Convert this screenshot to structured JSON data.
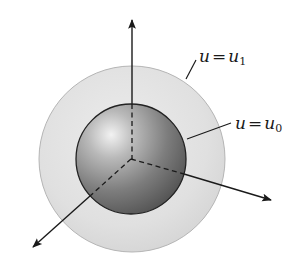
{
  "diagram": {
    "type": "concentric-spheres-3d-axes",
    "labels": {
      "outer": {
        "var": "u",
        "equals": "=",
        "rhs_var": "u",
        "rhs_sub": "1"
      },
      "inner": {
        "var": "u",
        "equals": "=",
        "rhs_var": "u",
        "rhs_sub": "0"
      }
    },
    "colors": {
      "outer_fill": "#e2e2e2",
      "outer_stroke": "#b5b5b5",
      "inner_light": "#f0f0f0",
      "inner_dark": "#5c5c5c",
      "inner_stroke": "#222222",
      "axis": "#1a1a1a"
    },
    "axes": [
      {
        "name": "vertical",
        "tip": [
          132,
          18
        ]
      },
      {
        "name": "right",
        "tip": [
          273,
          200
        ]
      },
      {
        "name": "left-down",
        "tip": [
          31,
          249
        ]
      }
    ],
    "center": [
      131,
      160
    ],
    "inner_radius": 55,
    "outer_radius": 93
  }
}
